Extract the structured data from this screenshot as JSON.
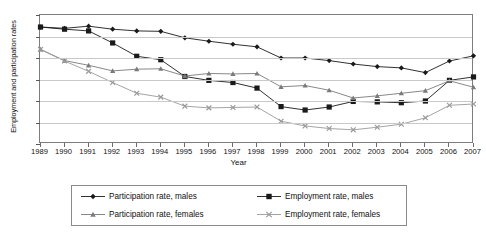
{
  "chart_data": {
    "type": "line",
    "title": "",
    "xlabel": "Year",
    "ylabel": "Employment and participation rates",
    "grid": true,
    "legend_position": "bottom",
    "xlim": [
      1989,
      2007
    ],
    "ylim": [
      60,
      90
    ],
    "ytick_step": 5,
    "yticks": [
      60,
      65,
      70,
      75,
      80,
      85,
      90
    ],
    "categories": [
      "1989",
      "1990",
      "1991",
      "1992",
      "1993",
      "1994",
      "1995",
      "1996",
      "1997",
      "1998",
      "1999",
      "2000",
      "2001",
      "2002",
      "2003",
      "2004",
      "2005",
      "2006",
      "2007"
    ],
    "series": [
      {
        "name": "Participation rate, males",
        "marker": "diamond",
        "color": "#1a1a1a",
        "values": [
          87.2,
          86.9,
          87.4,
          86.7,
          86.3,
          86.2,
          84.7,
          83.9,
          83.2,
          82.6,
          80.0,
          80.0,
          79.4,
          78.6,
          78.0,
          77.7,
          76.6,
          79.3,
          80.5
        ]
      },
      {
        "name": "Employment rate, males",
        "marker": "square",
        "color": "#1a1a1a",
        "values": [
          87.2,
          86.7,
          86.3,
          83.5,
          80.4,
          79.6,
          75.7,
          74.8,
          74.3,
          73.0,
          68.7,
          67.9,
          68.6,
          69.9,
          69.8,
          69.6,
          70.0,
          74.8,
          75.6
        ]
      },
      {
        "name": "Participation rate, females",
        "marker": "triangle",
        "color": "#7a7a7a",
        "values": [
          82.0,
          79.4,
          78.3,
          77.0,
          77.4,
          77.5,
          75.8,
          76.4,
          76.3,
          76.4,
          73.3,
          73.6,
          72.5,
          70.7,
          71.2,
          71.8,
          72.4,
          74.7,
          73.2
        ]
      },
      {
        "name": "Employment rate, females",
        "marker": "cross",
        "color": "#9a9a9a",
        "values": [
          82.0,
          79.3,
          76.9,
          74.3,
          71.8,
          70.9,
          68.8,
          68.4,
          68.5,
          68.6,
          65.3,
          64.2,
          63.6,
          63.3,
          63.9,
          64.6,
          66.1,
          69.0,
          69.3
        ]
      }
    ]
  },
  "legend": {
    "items": [
      "Participation rate, males",
      "Employment rate, males",
      "Participation rate, females",
      "Employment rate, females"
    ]
  }
}
